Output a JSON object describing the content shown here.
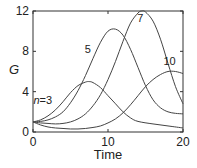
{
  "chart_data": {
    "type": "line",
    "title": "",
    "xlabel": "Time",
    "ylabel": "G",
    "xlim": [
      0,
      20
    ],
    "ylim": [
      0,
      12
    ],
    "xticks": [
      0,
      10,
      20
    ],
    "yticks": [
      0,
      4,
      8,
      12
    ],
    "xtick_labels": [
      "0",
      "10",
      "20"
    ],
    "ytick_labels": [
      "0",
      "4",
      "8",
      "12"
    ],
    "grid": false,
    "legend": "none (inline curve labels)",
    "series": [
      {
        "name": "n=3",
        "label": "n=3",
        "x": [
          0,
          1,
          2,
          3,
          4,
          5,
          6,
          7,
          7.5,
          8,
          9,
          10,
          11,
          12,
          13,
          14,
          16,
          18,
          20
        ],
        "y": [
          1.0,
          1.2,
          1.6,
          2.2,
          3.0,
          3.9,
          4.6,
          4.95,
          5.0,
          4.9,
          4.4,
          3.6,
          2.8,
          2.0,
          1.4,
          1.05,
          0.8,
          0.6,
          0.4
        ]
      },
      {
        "name": "n=5",
        "label": "5",
        "x": [
          0,
          1,
          2,
          3,
          4,
          5,
          6,
          7,
          8,
          9,
          10,
          11,
          12,
          13,
          14,
          15,
          16,
          17,
          18,
          19,
          20
        ],
        "y": [
          1.0,
          1.05,
          1.2,
          1.5,
          2.0,
          2.9,
          4.1,
          5.6,
          7.3,
          8.9,
          10.0,
          10.2,
          9.6,
          8.2,
          6.4,
          4.6,
          3.2,
          2.4,
          2.0,
          1.85,
          1.8
        ]
      },
      {
        "name": "n=7",
        "label": "7",
        "x": [
          0,
          1,
          2,
          3,
          4,
          5,
          6,
          7,
          8,
          9,
          10,
          11,
          12,
          13,
          14,
          14.5,
          15,
          16,
          17,
          18,
          19,
          20
        ],
        "y": [
          1.0,
          0.9,
          0.85,
          0.8,
          0.85,
          1.0,
          1.3,
          1.8,
          2.6,
          3.7,
          5.2,
          7.0,
          9.0,
          10.8,
          11.8,
          12.0,
          11.9,
          11.0,
          9.2,
          6.8,
          4.5,
          2.8
        ]
      },
      {
        "name": "n=10",
        "label": "10",
        "x": [
          0,
          1,
          2,
          3,
          4,
          5,
          6,
          7,
          8,
          9,
          10,
          11,
          12,
          13,
          14,
          15,
          16,
          17,
          18,
          19,
          20
        ],
        "y": [
          1.0,
          0.7,
          0.5,
          0.4,
          0.35,
          0.3,
          0.3,
          0.35,
          0.45,
          0.6,
          0.9,
          1.3,
          1.9,
          2.7,
          3.6,
          4.5,
          5.2,
          5.7,
          6.0,
          6.0,
          5.8
        ]
      }
    ],
    "annotations": [
      {
        "text": "n=3",
        "x": 1.3,
        "y": 2.8
      },
      {
        "text": "5",
        "x": 7.3,
        "y": 7.8
      },
      {
        "text": "7",
        "x": 14.3,
        "y": 10.9
      },
      {
        "text": "10",
        "x": 18.2,
        "y": 6.6
      }
    ]
  }
}
